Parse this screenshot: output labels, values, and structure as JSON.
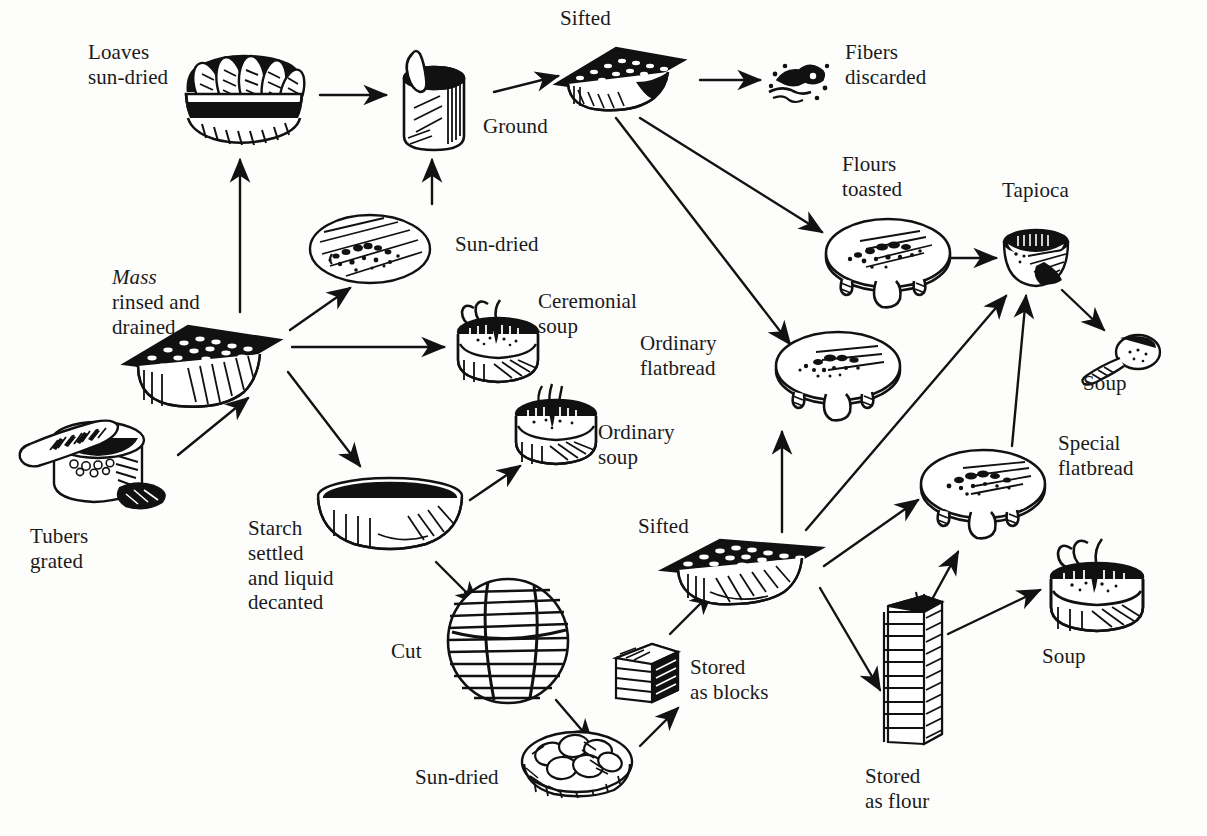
{
  "diagram": {
    "ink_color": "#111111",
    "background_color": "#fdfdfc",
    "labels": [
      {
        "id": "loaves-sun-dried",
        "text": "Loaves\nsun-dried",
        "x": 88,
        "y": 40,
        "align": "left"
      },
      {
        "id": "sifted-top",
        "text": "Sifted",
        "x": 560,
        "y": 6,
        "align": "left"
      },
      {
        "id": "ground",
        "text": "Ground",
        "x": 483,
        "y": 114,
        "align": "left"
      },
      {
        "id": "fibers-discarded",
        "text": "Fibers\ndiscarded",
        "x": 845,
        "y": 40,
        "align": "left"
      },
      {
        "id": "sun-dried-upper",
        "text": "Sun-dried",
        "x": 455,
        "y": 232,
        "align": "left"
      },
      {
        "id": "flours-toasted",
        "text": "Flours\ntoasted",
        "x": 842,
        "y": 152,
        "align": "left"
      },
      {
        "id": "tapioca",
        "text": "Tapioca",
        "x": 1002,
        "y": 178,
        "align": "left"
      },
      {
        "id": "mass-rinsed",
        "text": "Mass\nrinsed and\ndrained",
        "x": 112,
        "y": 265,
        "align": "left",
        "italic_first_word": true
      },
      {
        "id": "ceremonial-soup",
        "text": "Ceremonial\nsoup",
        "x": 538,
        "y": 289,
        "align": "left"
      },
      {
        "id": "ordinary-soup",
        "text": "Ordinary\nsoup",
        "x": 598,
        "y": 420,
        "align": "left"
      },
      {
        "id": "ordinary-flatbread",
        "text": "Ordinary\nflatbread",
        "x": 640,
        "y": 331,
        "align": "left"
      },
      {
        "id": "soup-spoon",
        "text": "Soup",
        "x": 1083,
        "y": 371,
        "align": "left"
      },
      {
        "id": "special-flatbread",
        "text": "Special\nflatbread",
        "x": 1058,
        "y": 431,
        "align": "left"
      },
      {
        "id": "tubers-grated",
        "text": "Tubers\ngrated",
        "x": 30,
        "y": 524,
        "align": "left"
      },
      {
        "id": "starch-settled",
        "text": "Starch\nsettled\nand liquid\ndecanted",
        "x": 248,
        "y": 516,
        "align": "left"
      },
      {
        "id": "sifted-lower",
        "text": "Sifted",
        "x": 638,
        "y": 514,
        "align": "left"
      },
      {
        "id": "cut",
        "text": "Cut",
        "x": 391,
        "y": 639,
        "align": "left"
      },
      {
        "id": "stored-as-blocks",
        "text": "Stored\nas blocks",
        "x": 690,
        "y": 655,
        "align": "left"
      },
      {
        "id": "soup-pot",
        "text": "Soup",
        "x": 1042,
        "y": 644,
        "align": "left"
      },
      {
        "id": "sun-dried-lower",
        "text": "Sun-dried",
        "x": 415,
        "y": 765,
        "align": "left"
      },
      {
        "id": "stored-as-flour",
        "text": "Stored\nas flour",
        "x": 865,
        "y": 764,
        "align": "left"
      }
    ],
    "nodes": [
      {
        "id": "basket-of-loaves",
        "name": "basket-of-loaves-icon",
        "x": 178,
        "y": 30,
        "w": 130,
        "h": 118
      },
      {
        "id": "mortar-pestle",
        "name": "mortar-and-pestle-icon",
        "x": 390,
        "y": 48,
        "w": 92,
        "h": 108
      },
      {
        "id": "sifter-top",
        "name": "sifter-tray-icon",
        "x": 550,
        "y": 42,
        "w": 140,
        "h": 72
      },
      {
        "id": "fibers-blob",
        "name": "discarded-fibers-icon",
        "x": 765,
        "y": 52,
        "w": 70,
        "h": 58
      },
      {
        "id": "mass-cake-sun",
        "name": "drying-mass-cake-icon",
        "x": 306,
        "y": 210,
        "w": 128,
        "h": 78
      },
      {
        "id": "toasting-griddle",
        "name": "toasting-griddle-icon",
        "x": 820,
        "y": 215,
        "w": 136,
        "h": 96
      },
      {
        "id": "tapioca-bowl",
        "name": "tapioca-bowl-icon",
        "x": 1000,
        "y": 222,
        "w": 72,
        "h": 70
      },
      {
        "id": "soup-spoon-icon",
        "name": "soup-spoon-icon",
        "x": 1078,
        "y": 332,
        "w": 86,
        "h": 56
      },
      {
        "id": "mass-press",
        "name": "drained-mass-block-icon",
        "x": 118,
        "y": 318,
        "w": 168,
        "h": 96
      },
      {
        "id": "ceremonial-pot",
        "name": "ceremonial-soup-pot-icon",
        "x": 450,
        "y": 298,
        "w": 96,
        "h": 94
      },
      {
        "id": "ordinary-pot",
        "name": "ordinary-soup-pot-icon",
        "x": 508,
        "y": 384,
        "w": 96,
        "h": 90
      },
      {
        "id": "ordinary-griddle",
        "name": "ordinary-flatbread-griddle-icon",
        "x": 770,
        "y": 330,
        "w": 136,
        "h": 96
      },
      {
        "id": "special-griddle",
        "name": "special-flatbread-griddle-icon",
        "x": 915,
        "y": 448,
        "w": 136,
        "h": 96
      },
      {
        "id": "grater-tubers",
        "name": "grating-board-and-tubers-icon",
        "x": 14,
        "y": 410,
        "w": 168,
        "h": 112
      },
      {
        "id": "starch-basin",
        "name": "starch-settling-basin-icon",
        "x": 312,
        "y": 474,
        "w": 156,
        "h": 86
      },
      {
        "id": "soup-pot-right",
        "name": "soup-pot-icon",
        "x": 1042,
        "y": 535,
        "w": 110,
        "h": 104
      },
      {
        "id": "sifter-lower",
        "name": "sifter-tray-icon",
        "x": 658,
        "y": 530,
        "w": 168,
        "h": 80
      },
      {
        "id": "flour-column",
        "name": "stored-flour-column-icon",
        "x": 872,
        "y": 592,
        "w": 78,
        "h": 164
      },
      {
        "id": "cut-ball",
        "name": "cut-starch-ball-icon",
        "x": 444,
        "y": 576,
        "w": 128,
        "h": 130
      },
      {
        "id": "block-stack",
        "name": "stored-blocks-icon",
        "x": 610,
        "y": 642,
        "w": 74,
        "h": 64
      },
      {
        "id": "sun-dried-cakes",
        "name": "sun-dried-cakes-basket-icon",
        "x": 518,
        "y": 724,
        "w": 118,
        "h": 74
      }
    ],
    "arrows": [
      {
        "id": "a1",
        "from": "basket-of-loaves",
        "to": "mortar-pestle",
        "d": "M 320 95 L 386 95"
      },
      {
        "id": "a2",
        "from": "mortar-pestle",
        "to": "sifter-top",
        "d": "M 494 92 L 558 76"
      },
      {
        "id": "a3",
        "from": "sifter-top",
        "to": "fibers-blob",
        "d": "M 700 80 L 760 80"
      },
      {
        "id": "a4",
        "from": "mass-press",
        "to": "basket-of-loaves",
        "d": "M 240 312 L 240 160"
      },
      {
        "id": "a5",
        "from": "mass-cake-sun",
        "to": "mortar-pestle",
        "d": "M 432 204 L 432 160"
      },
      {
        "id": "a6",
        "from": "mass-press",
        "to": "mass-cake-sun",
        "d": "M 290 330 L 350 288"
      },
      {
        "id": "a7",
        "from": "mass-press",
        "to": "ceremonial-pot",
        "d": "M 292 347 L 444 347"
      },
      {
        "id": "a8",
        "from": "mass-press",
        "to": "starch-basin",
        "d": "M 288 372 L 360 466"
      },
      {
        "id": "a9",
        "from": "grater-tubers",
        "to": "mass-press",
        "d": "M 178 455 L 248 398"
      },
      {
        "id": "a10",
        "from": "starch-basin",
        "to": "ordinary-pot",
        "d": "M 470 500 L 520 466"
      },
      {
        "id": "a11",
        "from": "starch-basin",
        "to": "cut-ball",
        "d": "M 436 562 L 478 604"
      },
      {
        "id": "a12",
        "from": "cut-ball",
        "to": "sun-dried-cakes",
        "d": "M 556 700 L 592 742"
      },
      {
        "id": "a13",
        "from": "sun-dried-cakes",
        "to": "block-stack",
        "d": "M 640 746 L 678 708"
      },
      {
        "id": "a14",
        "from": "block-stack",
        "to": "sifter-lower",
        "d": "M 670 634 L 712 592"
      },
      {
        "id": "a15",
        "from": "sifter-top",
        "to": "toasting-griddle",
        "d": "M 640 118 L 822 232"
      },
      {
        "id": "a16",
        "from": "sifter-top",
        "to": "ordinary-griddle",
        "d": "M 616 118 L 790 344"
      },
      {
        "id": "a17",
        "from": "toasting-griddle",
        "to": "tapioca-bowl",
        "d": "M 940 258 L 996 258"
      },
      {
        "id": "a18",
        "from": "tapioca-bowl",
        "to": "soup-spoon-icon",
        "d": "M 1062 290 L 1104 330"
      },
      {
        "id": "a19",
        "from": "sifter-lower",
        "to": "ordinary-griddle",
        "d": "M 782 532 L 782 432"
      },
      {
        "id": "a20",
        "from": "sifter-lower",
        "to": "tapioca-bowl",
        "d": "M 806 530 L 1006 296"
      },
      {
        "id": "a21",
        "from": "special-griddle",
        "to": "tapioca-bowl",
        "d": "M 1012 446 L 1026 296"
      },
      {
        "id": "a22",
        "from": "sifter-lower",
        "to": "special-griddle",
        "d": "M 824 566 L 918 500"
      },
      {
        "id": "a23",
        "from": "sifter-lower",
        "to": "flour-column",
        "d": "M 820 588 L 880 690"
      },
      {
        "id": "a24",
        "from": "flour-column",
        "to": "special-griddle",
        "d": "M 924 614 L 958 552"
      },
      {
        "id": "a25",
        "from": "flour-column",
        "to": "soup-pot-right",
        "d": "M 948 634 L 1040 590"
      }
    ],
    "flow_steps": [
      "Tubers grated",
      "Mass rinsed and drained",
      "Loaves sun-dried",
      "Ground",
      "Sifted",
      "Fibers discarded",
      "Sun-dried",
      "Flours toasted",
      "Tapioca",
      "Soup",
      "Ceremonial soup",
      "Ordinary soup",
      "Ordinary flatbread",
      "Starch settled and liquid decanted",
      "Cut",
      "Sun-dried",
      "Stored as blocks",
      "Sifted",
      "Special flatbread",
      "Stored as flour",
      "Soup"
    ]
  }
}
